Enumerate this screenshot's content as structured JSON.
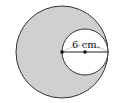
{
  "diagram": {
    "type": "geometry",
    "large_circle": {
      "cx": 62,
      "cy": 52,
      "r": 46,
      "fill": "#d0d0d0",
      "stroke": "#333333"
    },
    "small_circle": {
      "cx": 85,
      "cy": 52,
      "r": 23,
      "fill": "#ffffff",
      "stroke": "#333333"
    },
    "points": [
      {
        "name": "large-circle-center",
        "x": 62,
        "y": 52
      },
      {
        "name": "small-circle-center",
        "x": 85,
        "y": 52
      }
    ],
    "dimension_label": "6 cm."
  }
}
